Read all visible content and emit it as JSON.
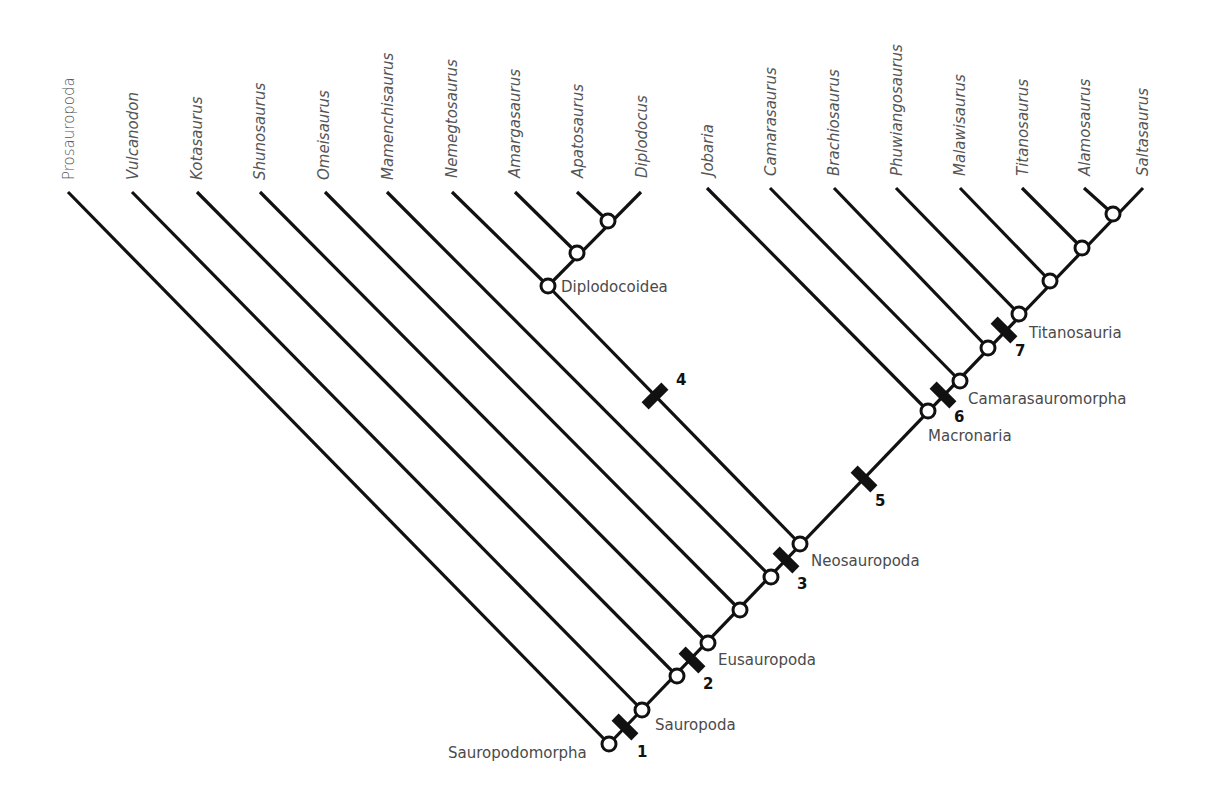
{
  "diagram": {
    "type": "cladogram",
    "taxa": [
      {
        "name": "Prosauropoda",
        "tipX": 68,
        "italic": false
      },
      {
        "name": "Vulcanodon",
        "tipX": 132,
        "italic": true
      },
      {
        "name": "Kotasaurus",
        "tipX": 197,
        "italic": true
      },
      {
        "name": "Shunosaurus",
        "tipX": 260,
        "italic": true
      },
      {
        "name": "Omeisaurus",
        "tipX": 325,
        "italic": true
      },
      {
        "name": "Mamenchisaurus",
        "tipX": 387,
        "italic": true
      },
      {
        "name": "Nemegtosaurus",
        "tipX": 452,
        "italic": true
      },
      {
        "name": "Amargasaurus",
        "tipX": 515,
        "italic": true
      },
      {
        "name": "Apatosaurus",
        "tipX": 577,
        "italic": true
      },
      {
        "name": "Diplodocus",
        "tipX": 641,
        "italic": true
      },
      {
        "name": "Jobaria",
        "tipX": 707,
        "italic": true
      },
      {
        "name": "Camarasaurus",
        "tipX": 770,
        "italic": true
      },
      {
        "name": "Brachiosaurus",
        "tipX": 834,
        "italic": true
      },
      {
        "name": "Phuwiangosaurus",
        "tipX": 896,
        "italic": true
      },
      {
        "name": "Malawisaurus",
        "tipX": 960,
        "italic": true
      },
      {
        "name": "Titanosaurus",
        "tipX": 1022,
        "italic": true
      },
      {
        "name": "Alamosaurus",
        "tipX": 1084,
        "italic": true
      },
      {
        "name": "Saltasaurus",
        "tipX": 1143,
        "italic": true
      }
    ],
    "clade_labels": {
      "sauropodomorpha": "Sauropodomorpha",
      "sauropoda": "Sauropoda",
      "eusauropoda": "Eusauropoda",
      "neosauropoda": "Neosauropoda",
      "diplodocoidea": "Diplodocoidea",
      "macronaria": "Macronaria",
      "camarasauromorpha": "Camarasauromorpha",
      "titanosauria": "Titanosauria"
    },
    "synapomorphy_marks": [
      "1",
      "2",
      "3",
      "4",
      "5",
      "6",
      "7"
    ],
    "colors": {
      "line": "#111111",
      "node_fill": "#ffffff",
      "taxon_text": "#555555",
      "clade_text": "#4a4a4a"
    }
  }
}
